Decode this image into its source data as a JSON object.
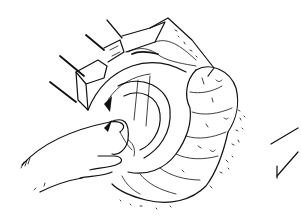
{
  "illustration": {
    "kind": "surgical line drawing",
    "subject": "open abdominal view with retractors, hand lifting bowel, loops of large intestine",
    "colors": {
      "ink": "#111111",
      "background": "#ffffff"
    },
    "elements": [
      {
        "name": "retractor-handles",
        "count": 4
      },
      {
        "name": "wound-edge-flap"
      },
      {
        "name": "hand"
      },
      {
        "name": "intestine-loops"
      },
      {
        "name": "pointer-marks",
        "count": 2
      }
    ]
  }
}
